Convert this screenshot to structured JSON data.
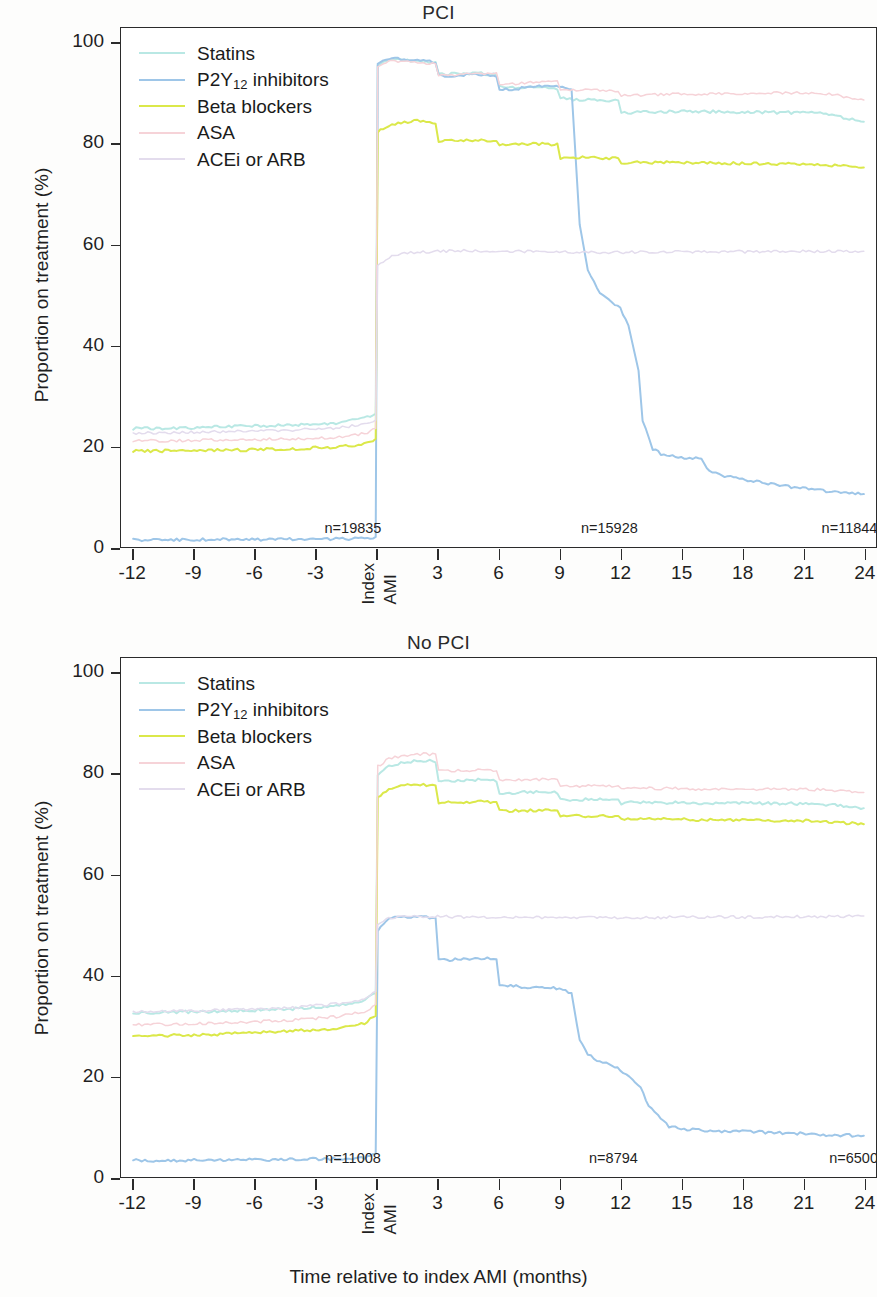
{
  "figure": {
    "x_axis_label": "Time relative to index AMI (months)",
    "y_axis_label": "Proportion on treatment (%)"
  },
  "legend": {
    "items": [
      {
        "label": "Statins",
        "label_main": "Statins",
        "sub": "",
        "label_tail": "",
        "color": "#b9e8e4"
      },
      {
        "label": "P2Y12 inhibitors",
        "label_main": "P2Y",
        "sub": "12",
        "label_tail": " inhibitors",
        "color": "#9ec6e8"
      },
      {
        "label": "Beta blockers",
        "label_main": "Beta blockers",
        "sub": "",
        "label_tail": "",
        "color": "#dbe84a"
      },
      {
        "label": "ASA",
        "label_main": "ASA",
        "sub": "",
        "label_tail": "",
        "color": "#f6d3d8"
      },
      {
        "label": "ACEi or ARB",
        "label_main": "ACEi or ARB",
        "sub": "",
        "label_tail": "",
        "color": "#e3dced"
      }
    ]
  },
  "chart_data": [
    {
      "type": "line",
      "title": "PCI",
      "xlabel": "Time relative to index AMI (months)",
      "ylabel": "Proportion on treatment (%)",
      "xlim": [
        -12.6,
        24.6
      ],
      "ylim": [
        0,
        103
      ],
      "xticks": [
        -12,
        -9,
        -6,
        -3,
        0,
        3,
        6,
        9,
        12,
        15,
        18,
        21,
        24
      ],
      "xticklabels": [
        "-12",
        "-9",
        "-6",
        "-3",
        "Index AMI",
        "3",
        "6",
        "9",
        "12",
        "15",
        "18",
        "21",
        "24"
      ],
      "yticks": [
        0,
        20,
        40,
        60,
        80,
        100
      ],
      "grid": false,
      "legend_position": "top-left",
      "annotations": [
        {
          "text": "n=19835",
          "x": -1.2,
          "y": 2.6
        },
        {
          "text": "n=15928",
          "x": 11.4,
          "y": 2.6
        },
        {
          "text": "n=11844",
          "x": 23.2,
          "y": 2.6
        }
      ],
      "series": [
        {
          "name": "Statins",
          "color": "#b9e8e4",
          "x": [
            -12,
            -10,
            -8,
            -6,
            -4,
            -2,
            -0.6,
            -0.05,
            0.05,
            0.6,
            1.2,
            2,
            2.9,
            3.05,
            4,
            5,
            5.9,
            6.05,
            7,
            8,
            8.9,
            9.05,
            10,
            11,
            11.9,
            12.05,
            13,
            14,
            15,
            16,
            17,
            18,
            19,
            20,
            21,
            22,
            23,
            24
          ],
          "values": [
            23.5,
            23.6,
            23.8,
            24.0,
            24.2,
            24.6,
            25.5,
            26.5,
            95.5,
            96.8,
            96.6,
            96.5,
            96.2,
            93.8,
            93.9,
            94.0,
            93.8,
            91.3,
            91.2,
            91.1,
            91.0,
            89.0,
            88.8,
            88.7,
            88.5,
            86.2,
            86.3,
            86.4,
            86.5,
            86.4,
            86.4,
            86.3,
            86.3,
            86.2,
            86.2,
            86.0,
            85.2,
            84.4
          ]
        },
        {
          "name": "P2Y12 inhibitors",
          "color": "#9ec6e8",
          "x": [
            -12,
            -10,
            -8,
            -6,
            -4,
            -2,
            -0.6,
            -0.05,
            0.05,
            0.6,
            1.2,
            2,
            2.9,
            3.05,
            4,
            5,
            5.9,
            6.05,
            7,
            8,
            9,
            9.6,
            10.0,
            10.4,
            11,
            11.6,
            12.0,
            12.4,
            12.9,
            13.1,
            13.6,
            14,
            15,
            16,
            16.4,
            17,
            18,
            19,
            20,
            21,
            22,
            23,
            24
          ],
          "values": [
            1.4,
            1.4,
            1.5,
            1.5,
            1.6,
            1.6,
            1.7,
            2.0,
            95.8,
            97.0,
            96.8,
            96.6,
            96.3,
            93.5,
            93.6,
            93.7,
            93.5,
            90.8,
            91.0,
            91.4,
            91.5,
            90.8,
            64.0,
            55.0,
            50.5,
            48.5,
            47.5,
            44.0,
            35.0,
            25.0,
            19.5,
            18.5,
            17.8,
            17.6,
            15.0,
            14.2,
            13.4,
            12.8,
            12.2,
            11.6,
            11.2,
            10.8,
            10.5
          ]
        },
        {
          "name": "Beta blockers",
          "color": "#dbe84a",
          "x": [
            -12,
            -10,
            -8,
            -6,
            -4,
            -2,
            -0.6,
            -0.05,
            0.05,
            0.6,
            1.2,
            2,
            2.9,
            3.05,
            4,
            5,
            5.9,
            6.05,
            7,
            8,
            8.9,
            9.05,
            10,
            11,
            11.9,
            12.05,
            13,
            14,
            15,
            16,
            17,
            18,
            19,
            20,
            21,
            22,
            23,
            24
          ],
          "values": [
            19.0,
            19.1,
            19.2,
            19.3,
            19.5,
            19.8,
            20.5,
            21.5,
            82.5,
            83.6,
            84.2,
            84.6,
            84.2,
            80.6,
            80.8,
            80.7,
            80.5,
            79.8,
            79.9,
            80.0,
            79.9,
            77.2,
            77.3,
            77.2,
            77.1,
            76.3,
            76.4,
            76.3,
            76.3,
            76.2,
            76.2,
            76.1,
            76.1,
            76.0,
            76.0,
            75.9,
            75.6,
            75.3
          ]
        },
        {
          "name": "ASA",
          "color": "#f6d3d8",
          "x": [
            -12,
            -10,
            -8,
            -6,
            -4,
            -2,
            -0.6,
            -0.05,
            0.05,
            0.6,
            1.2,
            2,
            2.9,
            3.05,
            4,
            5,
            5.9,
            6.05,
            7,
            8,
            8.9,
            9.05,
            10,
            11,
            11.9,
            12.05,
            13,
            14,
            15,
            16,
            17,
            18,
            19,
            20,
            21,
            22,
            23,
            24
          ],
          "values": [
            21.0,
            21.1,
            21.2,
            21.3,
            21.5,
            21.8,
            22.5,
            23.5,
            95.2,
            96.4,
            96.3,
            96.2,
            95.9,
            93.6,
            93.8,
            94.0,
            93.9,
            91.8,
            92.0,
            92.2,
            92.3,
            90.5,
            90.6,
            90.7,
            90.6,
            89.5,
            89.7,
            89.8,
            89.9,
            89.9,
            89.9,
            89.9,
            90.0,
            90.1,
            90.2,
            90.1,
            89.4,
            88.7
          ]
        },
        {
          "name": "ACEi or ARB",
          "color": "#e3dced",
          "x": [
            -12,
            -10,
            -8,
            -6,
            -4,
            -2,
            -0.6,
            -0.05,
            0.05,
            0.6,
            1.2,
            2,
            3,
            4,
            5,
            6,
            7,
            8,
            9,
            10,
            11,
            12,
            13,
            14,
            15,
            16,
            17,
            18,
            19,
            20,
            21,
            22,
            23,
            24
          ],
          "values": [
            22.6,
            22.7,
            22.9,
            23.0,
            23.2,
            23.6,
            24.3,
            25.2,
            56.0,
            57.5,
            58.2,
            58.5,
            58.7,
            58.8,
            58.8,
            58.7,
            58.7,
            58.6,
            58.6,
            58.5,
            58.5,
            58.5,
            58.5,
            58.6,
            58.6,
            58.6,
            58.6,
            58.6,
            58.6,
            58.6,
            58.7,
            58.7,
            58.7,
            58.7
          ]
        }
      ]
    },
    {
      "type": "line",
      "title": "No PCI",
      "xlabel": "Time relative to index AMI (months)",
      "ylabel": "Proportion on treatment (%)",
      "xlim": [
        -12.6,
        24.6
      ],
      "ylim": [
        0,
        103
      ],
      "xticks": [
        -12,
        -9,
        -6,
        -3,
        0,
        3,
        6,
        9,
        12,
        15,
        18,
        21,
        24
      ],
      "xticklabels": [
        "-12",
        "-9",
        "-6",
        "-3",
        "Index AMI",
        "3",
        "6",
        "9",
        "12",
        "15",
        "18",
        "21",
        "24"
      ],
      "yticks": [
        0,
        20,
        40,
        60,
        80,
        100
      ],
      "grid": false,
      "legend_position": "top-left",
      "annotations": [
        {
          "text": "n=11008",
          "x": -1.2,
          "y": 2.6
        },
        {
          "text": "n=8794",
          "x": 11.6,
          "y": 2.6
        },
        {
          "text": "n=6500",
          "x": 23.4,
          "y": 2.6
        }
      ],
      "series": [
        {
          "name": "Statins",
          "color": "#b9e8e4",
          "x": [
            -12,
            -10,
            -8,
            -6,
            -4,
            -2,
            -0.6,
            -0.05,
            0.05,
            0.6,
            1.2,
            2,
            2.9,
            3.05,
            4,
            5,
            5.9,
            6.05,
            7,
            8,
            8.9,
            9.05,
            10,
            11,
            11.9,
            12.05,
            13,
            14,
            15,
            16,
            17,
            18,
            19,
            20,
            21,
            22,
            23,
            24
          ],
          "values": [
            32.6,
            32.7,
            32.9,
            33.1,
            33.4,
            34.0,
            35.0,
            36.5,
            80.0,
            81.5,
            82.2,
            82.6,
            82.5,
            78.5,
            78.7,
            78.8,
            78.6,
            76.2,
            76.3,
            76.4,
            76.3,
            74.8,
            74.9,
            75.0,
            74.9,
            74.2,
            74.4,
            74.3,
            74.3,
            74.2,
            74.3,
            74.2,
            74.2,
            74.1,
            74.1,
            74.0,
            73.6,
            73.2
          ]
        },
        {
          "name": "P2Y12 inhibitors",
          "color": "#9ec6e8",
          "x": [
            -12,
            -10,
            -8,
            -6,
            -4,
            -2,
            -0.6,
            -0.05,
            0.05,
            0.6,
            1.2,
            2,
            2.9,
            3.05,
            3.6,
            4,
            5,
            5.9,
            6.05,
            6.6,
            7,
            8,
            9,
            9.6,
            10.0,
            10.4,
            11,
            11.6,
            12,
            12.6,
            13,
            13.4,
            14,
            14.4,
            15,
            16,
            17,
            18,
            19,
            20,
            21,
            22,
            23,
            24
          ],
          "values": [
            3.3,
            3.3,
            3.4,
            3.4,
            3.5,
            3.6,
            3.8,
            4.6,
            49.0,
            51.5,
            51.8,
            51.6,
            51.4,
            43.0,
            43.0,
            43.2,
            43.4,
            43.5,
            38.2,
            38.0,
            37.8,
            37.6,
            37.4,
            36.5,
            27.0,
            24.2,
            23.0,
            22.2,
            21.2,
            19.5,
            18.0,
            14.0,
            11.5,
            10.0,
            9.6,
            9.3,
            9.1,
            9.0,
            8.9,
            8.7,
            8.6,
            8.4,
            8.3,
            8.2
          ]
        },
        {
          "name": "Beta blockers",
          "color": "#dbe84a",
          "x": [
            -12,
            -10,
            -8,
            -6,
            -4,
            -2,
            -0.6,
            -0.05,
            0.05,
            0.6,
            1.2,
            2,
            2.9,
            3.05,
            4,
            5,
            5.9,
            6.05,
            7,
            8,
            8.9,
            9.05,
            10,
            11,
            11.9,
            12.05,
            13,
            14,
            15,
            16,
            17,
            18,
            19,
            20,
            21,
            22,
            23,
            24
          ],
          "values": [
            28.0,
            28.1,
            28.3,
            28.6,
            29.0,
            29.5,
            30.5,
            32.0,
            75.5,
            77.0,
            77.6,
            77.9,
            77.6,
            74.3,
            74.4,
            74.5,
            74.4,
            72.6,
            72.7,
            72.8,
            72.7,
            71.6,
            71.7,
            71.6,
            71.5,
            71.0,
            71.1,
            71.0,
            71.0,
            70.9,
            70.9,
            70.8,
            70.8,
            70.7,
            70.7,
            70.6,
            70.3,
            70.0
          ]
        },
        {
          "name": "ASA",
          "color": "#f6d3d8",
          "x": [
            -12,
            -10,
            -8,
            -6,
            -4,
            -2,
            -0.6,
            -0.05,
            0.05,
            0.6,
            1.2,
            2,
            2.9,
            3.05,
            4,
            5,
            5.9,
            6.05,
            7,
            8,
            8.9,
            9.05,
            10,
            11,
            11.9,
            12.05,
            13,
            14,
            15,
            16,
            17,
            18,
            19,
            20,
            21,
            22,
            23,
            24
          ],
          "values": [
            30.2,
            30.3,
            30.5,
            30.8,
            31.2,
            31.8,
            32.8,
            34.2,
            81.5,
            83.0,
            83.6,
            84.0,
            83.8,
            80.5,
            80.7,
            80.8,
            80.7,
            78.6,
            78.8,
            78.9,
            78.8,
            77.5,
            77.6,
            77.7,
            77.6,
            77.0,
            77.2,
            77.1,
            77.1,
            77.0,
            77.1,
            77.0,
            77.0,
            77.0,
            76.9,
            76.9,
            76.6,
            76.3
          ]
        },
        {
          "name": "ACEi or ARB",
          "color": "#e3dced",
          "x": [
            -12,
            -10,
            -8,
            -6,
            -4,
            -2,
            -0.6,
            -0.05,
            0.05,
            0.6,
            1.2,
            2,
            3,
            4,
            5,
            6,
            7,
            8,
            9,
            10,
            11,
            12,
            13,
            14,
            15,
            16,
            17,
            18,
            19,
            20,
            21,
            22,
            23,
            24
          ],
          "values": [
            32.8,
            32.9,
            33.1,
            33.3,
            33.7,
            34.3,
            35.3,
            36.8,
            50.0,
            51.4,
            51.7,
            51.8,
            51.7,
            51.6,
            51.6,
            51.5,
            51.5,
            51.5,
            51.5,
            51.5,
            51.5,
            51.5,
            51.5,
            51.5,
            51.6,
            51.6,
            51.6,
            51.6,
            51.6,
            51.7,
            51.7,
            51.7,
            51.7,
            51.8
          ]
        }
      ]
    }
  ]
}
